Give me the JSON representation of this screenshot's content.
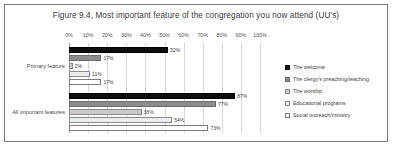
{
  "chart_data": {
    "type": "bar",
    "orientation": "horizontal",
    "title": "Figure 9.4, Most important feature of the congregation you now attend (UU's)",
    "xlabel": "",
    "ylabel": "",
    "xlim": [
      0,
      100
    ],
    "grid": true,
    "legend_position": "right",
    "categories": [
      "Primary feature",
      "All important features"
    ],
    "x_ticks": [
      "0%",
      "10%",
      "20%",
      "30%",
      "40%",
      "50%",
      "60%",
      "70%",
      "80%",
      "90%",
      "100%"
    ],
    "x_tick_values": [
      0,
      10,
      20,
      30,
      40,
      50,
      60,
      70,
      80,
      90,
      100
    ],
    "series": [
      {
        "name": "The welcome",
        "color": "#0d0d0d",
        "values": [
          52,
          87
        ],
        "labels": [
          "52%",
          "87%"
        ]
      },
      {
        "name": "The clergy's preaching/teaching",
        "color": "#8c8c8c",
        "values": [
          17,
          77
        ],
        "labels": [
          "17%",
          "77%"
        ]
      },
      {
        "name": "The worship",
        "color": "#c9c9c9",
        "values": [
          2,
          38
        ],
        "labels": [
          "2%",
          "38%"
        ]
      },
      {
        "name": "Educational programs",
        "color": "#ededed",
        "values": [
          11,
          54
        ],
        "labels": [
          "11%",
          "54%"
        ]
      },
      {
        "name": "Social outreach/ministry",
        "color": "#ffffff",
        "values": [
          17,
          73
        ],
        "labels": [
          "17%",
          "73%"
        ]
      }
    ]
  }
}
